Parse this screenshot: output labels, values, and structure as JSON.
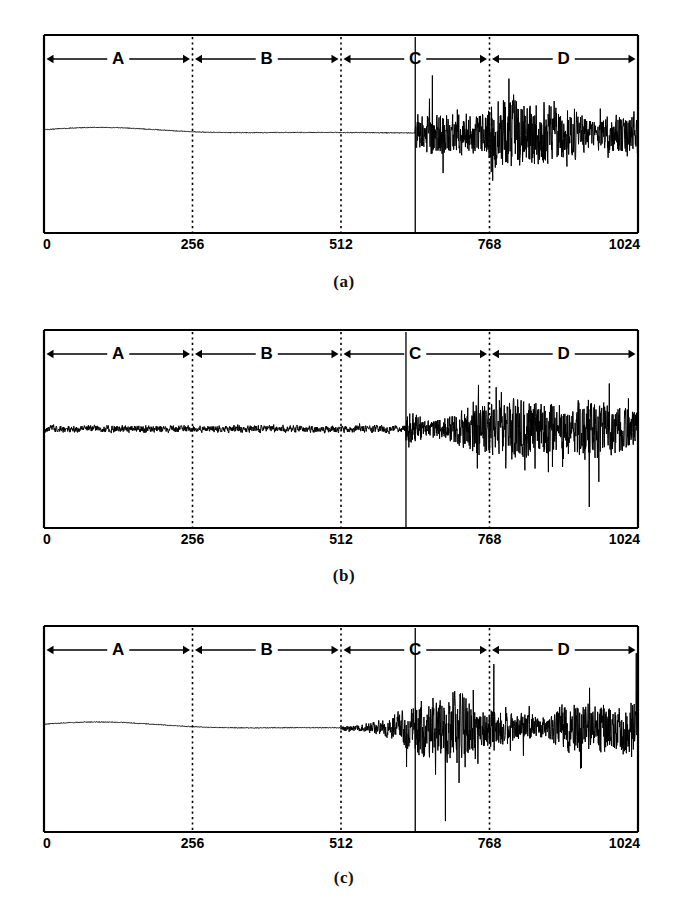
{
  "figure": {
    "background": "#ffffff",
    "ink": "#000000"
  },
  "chart_data": {
    "type": "line",
    "title": "",
    "xlabel": "",
    "ylabel": "",
    "xlim": [
      0,
      1024
    ],
    "ylim": [
      -1,
      1
    ],
    "grid": false,
    "legend": "none",
    "x_ticks": [
      0,
      256,
      512,
      768,
      1024
    ],
    "x_tick_labels": [
      "0",
      "256",
      "512",
      "768",
      "1024"
    ],
    "region_labels": [
      "A",
      "B",
      "C",
      "D"
    ],
    "region_bounds": [
      [
        0,
        256
      ],
      [
        256,
        512
      ],
      [
        512,
        768
      ],
      [
        768,
        1024
      ]
    ],
    "panels": [
      {
        "caption": "(a)",
        "description": "smooth low-frequency baseline through A, B and early C, abrupt high-amplitude noise burst from 640 to 1024",
        "noise_onset": 640,
        "baseline_bump_center": 96,
        "baseline_bump_amplitude": 0.08,
        "quiet_noise_amplitude": 0.004,
        "burst_amplitude": 0.82,
        "solid_marker_x": 640,
        "series": [
          {
            "name": "signal-a",
            "segments": [
              {
                "x_start": 0,
                "x_end": 640,
                "kind": "smooth",
                "amplitude": 0.08
              },
              {
                "x_start": 640,
                "x_end": 1024,
                "kind": "burst",
                "amplitude": 0.82
              }
            ]
          }
        ]
      },
      {
        "caption": "(b)",
        "description": "continuous low-amplitude noise through A, B and early C, abrupt high-amplitude noise burst from 624 to 1024",
        "noise_onset": 624,
        "baseline_bump_center": 0,
        "baseline_bump_amplitude": 0.0,
        "quiet_noise_amplitude": 0.055,
        "burst_amplitude": 0.8,
        "solid_marker_x": 624,
        "series": [
          {
            "name": "signal-b",
            "segments": [
              {
                "x_start": 0,
                "x_end": 624,
                "kind": "noise",
                "amplitude": 0.055
              },
              {
                "x_start": 624,
                "x_end": 1024,
                "kind": "burst",
                "amplitude": 0.8
              }
            ]
          }
        ]
      },
      {
        "caption": "(c)",
        "description": "smooth baseline with bump through A and B, small growing noise from 512, full high-amplitude burst from 640 to 1024",
        "noise_onset": 512,
        "baseline_bump_center": 96,
        "baseline_bump_amplitude": 0.08,
        "quiet_noise_amplitude": 0.004,
        "burst_amplitude": 0.82,
        "solid_marker_x": 640,
        "series": [
          {
            "name": "signal-c",
            "segments": [
              {
                "x_start": 0,
                "x_end": 512,
                "kind": "smooth",
                "amplitude": 0.08
              },
              {
                "x_start": 512,
                "x_end": 640,
                "kind": "ramp",
                "amplitude": 0.3
              },
              {
                "x_start": 640,
                "x_end": 1024,
                "kind": "burst",
                "amplitude": 0.82
              }
            ]
          }
        ]
      }
    ]
  },
  "layout": {
    "plot_left": 44,
    "plot_right": 638,
    "panel_tops": [
      35,
      330,
      626
    ],
    "panel_heights": [
      198,
      198,
      206
    ],
    "caption_tops": [
      272,
      566,
      868
    ]
  }
}
